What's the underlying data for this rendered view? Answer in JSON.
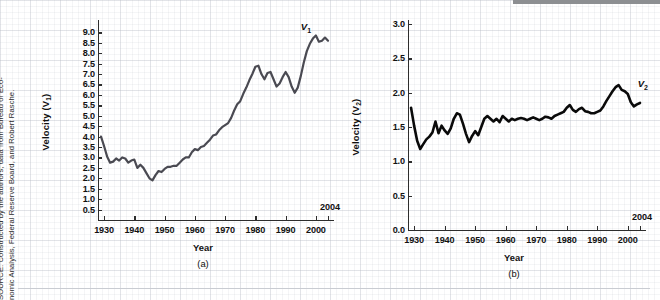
{
  "figure": {
    "source_note": "SOURCE: Constructed by the authors; data from Bureau of Economic Analysis, Federal Reserve Board, and Robert Rasche.",
    "source_line1": "SOURCE: Constructed by the authors; data from Bureau of Eco-",
    "source_line2": "nomic Analysis, Federal Reserve Board, and Robert Rasche."
  },
  "chart_data": [
    {
      "type": "line",
      "panel": "(a)",
      "title": "",
      "xlabel": "Year",
      "ylabel": "Velocity (V₁)",
      "ylabel_base": "Velocity (V",
      "ylabel_sub": "1",
      "ylabel_tail": ")",
      "series_label": "V",
      "series_label_sub": "1",
      "end_year_annotation": "2004",
      "xlim": [
        1928,
        2004
      ],
      "ylim": [
        0,
        9.4
      ],
      "grid": true,
      "legend_position": "inline-right",
      "yticks": [
        0.5,
        1.0,
        1.5,
        2.0,
        2.5,
        3.0,
        3.5,
        4.0,
        4.5,
        5.0,
        5.5,
        6.0,
        6.5,
        7.0,
        7.5,
        8.0,
        8.5,
        9.0
      ],
      "ytick_labels": [
        "0.5",
        "1.0",
        "1.5",
        "2.0",
        "2.5",
        "3.0",
        "3.5",
        "4.0",
        "4.5",
        "5.0",
        "5.5",
        "6.0",
        "6.5",
        "7.0",
        "7.5",
        "8.0",
        "8.5",
        "9.0"
      ],
      "xticks": [
        1930,
        1940,
        1950,
        1960,
        1970,
        1980,
        1990,
        2000
      ],
      "xtick_labels": [
        "1930",
        "1940",
        "1950",
        "1960",
        "1970",
        "1980",
        "1990",
        "2000"
      ],
      "x": [
        1929,
        1930,
        1931,
        1932,
        1933,
        1934,
        1935,
        1936,
        1937,
        1938,
        1939,
        1940,
        1941,
        1942,
        1943,
        1944,
        1945,
        1946,
        1947,
        1948,
        1949,
        1950,
        1951,
        1952,
        1953,
        1954,
        1955,
        1956,
        1957,
        1958,
        1959,
        1960,
        1961,
        1962,
        1963,
        1964,
        1965,
        1966,
        1967,
        1968,
        1969,
        1970,
        1971,
        1972,
        1973,
        1974,
        1975,
        1976,
        1977,
        1978,
        1979,
        1980,
        1981,
        1982,
        1983,
        1984,
        1985,
        1986,
        1987,
        1988,
        1989,
        1990,
        1991,
        1992,
        1993,
        1994,
        1995,
        1996,
        1997,
        1998,
        1999,
        2000,
        2001,
        2002,
        2003,
        2004
      ],
      "y": [
        4.0,
        3.55,
        3.05,
        2.75,
        2.8,
        2.95,
        2.85,
        3.0,
        2.95,
        2.75,
        2.85,
        2.9,
        2.5,
        2.65,
        2.5,
        2.25,
        2.0,
        1.9,
        2.15,
        2.35,
        2.3,
        2.45,
        2.55,
        2.55,
        2.6,
        2.6,
        2.75,
        2.9,
        3.0,
        3.0,
        3.25,
        3.4,
        3.35,
        3.5,
        3.55,
        3.7,
        3.85,
        4.05,
        4.1,
        4.3,
        4.45,
        4.55,
        4.65,
        4.9,
        5.25,
        5.55,
        5.7,
        6.05,
        6.35,
        6.7,
        7.0,
        7.35,
        7.4,
        7.0,
        6.75,
        7.05,
        7.1,
        6.75,
        6.4,
        6.55,
        6.85,
        7.1,
        6.85,
        6.4,
        6.1,
        6.35,
        6.9,
        7.55,
        8.1,
        8.45,
        8.7,
        8.85,
        8.55,
        8.6,
        8.75,
        8.6
      ],
      "line_color": "#4a4a52",
      "line_width": 2.2
    },
    {
      "type": "line",
      "panel": "(b)",
      "title": "",
      "xlabel": "Year",
      "ylabel": "Velocity (V₂)",
      "ylabel_base": "Velocity (V",
      "ylabel_sub": "2",
      "ylabel_tail": ")",
      "series_label": "V",
      "series_label_sub": "2",
      "end_year_annotation": "2004",
      "xlim": [
        1928,
        2004
      ],
      "ylim": [
        0,
        3.0
      ],
      "grid": true,
      "legend_position": "inline-right",
      "yticks": [
        0.0,
        0.5,
        1.0,
        1.5,
        2.0,
        2.5,
        3.0
      ],
      "ytick_labels": [
        "0.0",
        "0.5",
        "1.0",
        "1.5",
        "2.0",
        "2.5",
        "3.0"
      ],
      "xticks": [
        1930,
        1940,
        1950,
        1960,
        1970,
        1980,
        1990,
        2000
      ],
      "xtick_labels": [
        "1930",
        "1940",
        "1950",
        "1960",
        "1970",
        "1980",
        "1990",
        "2000"
      ],
      "x": [
        1929,
        1930,
        1931,
        1932,
        1933,
        1934,
        1935,
        1936,
        1937,
        1938,
        1939,
        1940,
        1941,
        1942,
        1943,
        1944,
        1945,
        1946,
        1947,
        1948,
        1949,
        1950,
        1951,
        1952,
        1953,
        1954,
        1955,
        1956,
        1957,
        1958,
        1959,
        1960,
        1961,
        1962,
        1963,
        1964,
        1965,
        1966,
        1967,
        1968,
        1969,
        1970,
        1971,
        1972,
        1973,
        1974,
        1975,
        1976,
        1977,
        1978,
        1979,
        1980,
        1981,
        1982,
        1983,
        1984,
        1985,
        1986,
        1987,
        1988,
        1989,
        1990,
        1991,
        1992,
        1993,
        1994,
        1995,
        1996,
        1997,
        1998,
        1999,
        2000,
        2001,
        2002,
        2003,
        2004
      ],
      "y": [
        1.78,
        1.52,
        1.3,
        1.18,
        1.25,
        1.32,
        1.36,
        1.42,
        1.58,
        1.41,
        1.52,
        1.45,
        1.4,
        1.48,
        1.62,
        1.7,
        1.68,
        1.55,
        1.4,
        1.28,
        1.37,
        1.44,
        1.38,
        1.5,
        1.62,
        1.66,
        1.62,
        1.58,
        1.62,
        1.57,
        1.66,
        1.62,
        1.58,
        1.62,
        1.6,
        1.62,
        1.63,
        1.62,
        1.6,
        1.62,
        1.64,
        1.62,
        1.6,
        1.62,
        1.65,
        1.64,
        1.62,
        1.66,
        1.68,
        1.7,
        1.72,
        1.78,
        1.82,
        1.75,
        1.72,
        1.76,
        1.78,
        1.73,
        1.72,
        1.7,
        1.7,
        1.72,
        1.74,
        1.8,
        1.88,
        1.95,
        2.02,
        2.08,
        2.11,
        2.04,
        2.02,
        1.98,
        1.86,
        1.8,
        1.83,
        1.85
      ],
      "line_color": "#0a0a0a",
      "line_width": 2.6
    }
  ]
}
